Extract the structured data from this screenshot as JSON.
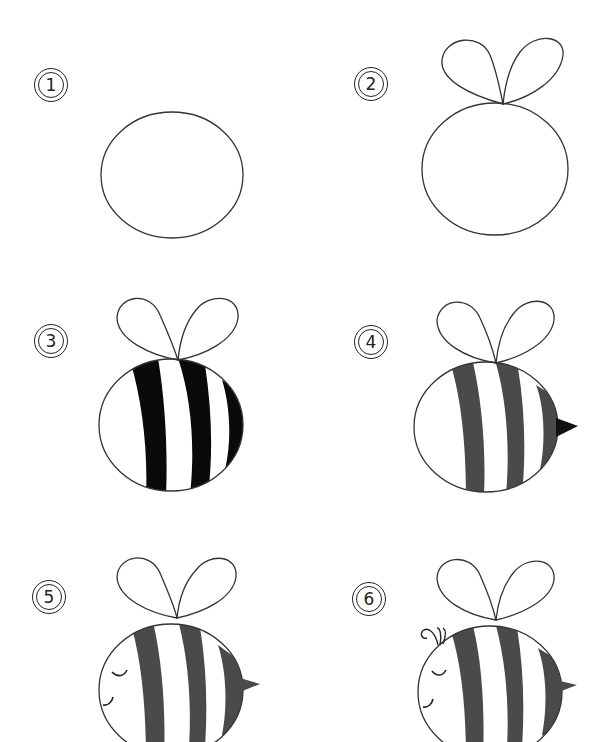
{
  "colors": {
    "outline": "#333333",
    "stripe_step3": "#0a0a0a",
    "stripe": "#4a4a4a",
    "stinger_step4": "#111111"
  },
  "steps": [
    {
      "number": "1",
      "description": "circle body"
    },
    {
      "number": "2",
      "description": "add wings"
    },
    {
      "number": "3",
      "description": "add stripes"
    },
    {
      "number": "4",
      "description": "add stinger"
    },
    {
      "number": "5",
      "description": "add face"
    },
    {
      "number": "6",
      "description": "add antennae"
    }
  ]
}
